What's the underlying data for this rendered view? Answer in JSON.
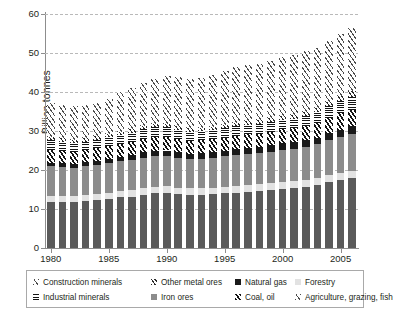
{
  "chart_data": {
    "type": "bar",
    "stacked": true,
    "title": "",
    "xlabel": "",
    "ylabel": "Billion tonnes",
    "ylim": [
      0,
      60
    ],
    "yticks": [
      0,
      10,
      20,
      30,
      40,
      50,
      60
    ],
    "ytick_labels": [
      "0",
      "10",
      "20",
      "30",
      "40",
      "50",
      "60"
    ],
    "grid": true,
    "grid_axis": "y",
    "legend_position": "bottom",
    "categories": [
      1980,
      1981,
      1982,
      1983,
      1984,
      1985,
      1986,
      1987,
      1988,
      1989,
      1990,
      1991,
      1992,
      1993,
      1994,
      1995,
      1996,
      1997,
      1998,
      1999,
      2000,
      2001,
      2002,
      2003,
      2004,
      2005,
      2006
    ],
    "xtick_labels": [
      "1980",
      "1985",
      "1990",
      "1995",
      "2000",
      "2005"
    ],
    "xticks": [
      1980,
      1985,
      1990,
      1995,
      2000,
      2005
    ],
    "series": [
      {
        "name": "Construction minerals",
        "pattern": "light-diagonal-hatch",
        "stack_order": 1,
        "values": [
          11.9,
          11.8,
          11.8,
          12.0,
          12.3,
          12.6,
          13.0,
          13.2,
          13.7,
          14.0,
          14.1,
          13.8,
          13.6,
          13.6,
          13.8,
          14.0,
          14.2,
          14.4,
          14.5,
          14.8,
          15.1,
          15.3,
          15.6,
          16.1,
          16.8,
          17.4,
          17.9
        ]
      },
      {
        "name": "Forestry",
        "pattern": "light-gray-solid",
        "stack_order": 2,
        "values": [
          1.5,
          1.5,
          1.5,
          1.6,
          1.6,
          1.6,
          1.6,
          1.7,
          1.7,
          1.7,
          1.7,
          1.7,
          1.7,
          1.7,
          1.7,
          1.7,
          1.7,
          1.8,
          1.8,
          1.8,
          1.8,
          1.8,
          1.8,
          1.8,
          1.8,
          1.8,
          1.8
        ]
      },
      {
        "name": "Iron ores",
        "pattern": "medium-gray-solid",
        "stack_order": 3,
        "values": [
          7.5,
          7.4,
          7.3,
          7.3,
          7.4,
          7.5,
          7.6,
          7.7,
          7.8,
          7.9,
          7.9,
          7.7,
          7.6,
          7.6,
          7.7,
          7.8,
          7.9,
          8.0,
          8.0,
          8.1,
          8.3,
          8.4,
          8.5,
          8.7,
          9.0,
          9.3,
          9.6
        ]
      },
      {
        "name": "Natural gas",
        "pattern": "black-solid",
        "stack_order": 4,
        "values": [
          1.0,
          1.0,
          1.0,
          1.1,
          1.1,
          1.2,
          1.2,
          1.2,
          1.3,
          1.3,
          1.3,
          1.3,
          1.3,
          1.4,
          1.4,
          1.4,
          1.5,
          1.5,
          1.5,
          1.6,
          1.6,
          1.6,
          1.7,
          1.7,
          1.8,
          1.8,
          1.9
        ]
      },
      {
        "name": "Coal, oil",
        "pattern": "black-diagonal-hatch",
        "stack_order": 5,
        "values": [
          3.3,
          3.2,
          3.1,
          3.1,
          3.2,
          3.3,
          3.3,
          3.4,
          3.5,
          3.5,
          3.5,
          3.4,
          3.3,
          3.3,
          3.3,
          3.4,
          3.5,
          3.5,
          3.5,
          3.5,
          3.6,
          3.6,
          3.6,
          3.8,
          4.0,
          4.2,
          4.3
        ]
      },
      {
        "name": "Industrial minerals",
        "pattern": "horizontal-stripes",
        "stack_order": 6,
        "values": [
          2.5,
          2.4,
          2.3,
          2.2,
          2.2,
          2.3,
          2.3,
          2.4,
          2.4,
          2.5,
          2.5,
          2.4,
          2.3,
          2.3,
          2.3,
          2.4,
          2.4,
          2.4,
          2.4,
          2.5,
          2.5,
          2.5,
          2.6,
          2.7,
          2.9,
          3.1,
          3.3
        ]
      },
      {
        "name": "Other metal ores",
        "pattern": "dense-diagonal-hatch",
        "stack_order": 7,
        "values": [
          0.8,
          0.8,
          0.8,
          0.8,
          0.8,
          0.8,
          0.8,
          0.8,
          0.9,
          0.9,
          0.9,
          0.9,
          0.9,
          0.9,
          0.9,
          0.9,
          0.9,
          1.0,
          1.0,
          1.0,
          1.0,
          1.0,
          1.1,
          1.1,
          1.2,
          1.3,
          1.4
        ]
      },
      {
        "name": "Agriculture, grazing, fish",
        "pattern": "wide-diagonal-hatch",
        "stack_order": 8,
        "values": [
          8.6,
          8.5,
          8.5,
          8.5,
          8.6,
          9.0,
          10.2,
          10.6,
          11.0,
          11.6,
          12.1,
          12.6,
          12.7,
          12.9,
          13.2,
          13.8,
          14.2,
          14.2,
          14.4,
          14.7,
          15.0,
          15.3,
          15.5,
          15.4,
          15.5,
          15.9,
          16.2
        ]
      }
    ],
    "totals": [
      37.1,
      36.6,
      36.3,
      36.6,
      37.2,
      38.3,
      40.0,
      41.0,
      42.3,
      43.4,
      44.0,
      43.8,
      43.4,
      43.7,
      44.3,
      45.4,
      46.3,
      46.8,
      47.1,
      48.0,
      48.9,
      49.5,
      50.4,
      51.3,
      52.9,
      54.8,
      56.4
    ]
  },
  "axis": {
    "ylabel": "Billion tonnes"
  },
  "legend": {
    "row1": [
      {
        "label": "Construction minerals",
        "swatch": "light-diagonal-hatch"
      },
      {
        "label": "Other metal ores",
        "swatch": "dense-diagonal-hatch"
      },
      {
        "label": "Natural gas",
        "swatch": "black-solid"
      },
      {
        "label": "Forestry",
        "swatch": "light-gray-solid"
      }
    ],
    "row2": [
      {
        "label": "Industrial minerals",
        "swatch": "horizontal-stripes"
      },
      {
        "label": "Iron ores",
        "swatch": "medium-gray-solid"
      },
      {
        "label": "Coal, oil",
        "swatch": "black-diagonal-hatch"
      },
      {
        "label": "Agriculture, grazing, fish",
        "swatch": "wide-diagonal-hatch"
      }
    ]
  },
  "colors": {
    "construction": "#5a5a5a",
    "forestry": "#e2e2e2",
    "iron_ores": "#8c8c8c",
    "natural_gas": "#1a1a1a",
    "grid": "#b9b9b9",
    "axis": "#8d8d8d",
    "text": "#231f20"
  }
}
